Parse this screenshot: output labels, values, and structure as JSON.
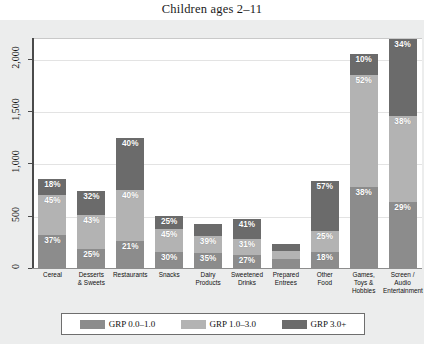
{
  "chart_data": {
    "type": "bar",
    "subtype": "stacked-bar",
    "title": "Children ages 2–11",
    "xlabel": "",
    "ylabel": "",
    "ylim": [
      0,
      2200
    ],
    "yticks": [
      0,
      500,
      1000,
      1500,
      2000
    ],
    "ytick_labels": [
      "0",
      "500",
      "1,000",
      "1,500",
      "2,000"
    ],
    "grid": true,
    "legend_position": "bottom",
    "stacked": true,
    "categories": [
      "Cereal",
      "Desserts\n& Sweets",
      "Restaurants",
      "Snacks",
      "Dairy\nProducts",
      "Sweetened\nDrinks",
      "Prepared\nEntrees",
      "Other\nFood",
      "Games,\nToys &\nHobbies",
      "Screen /\nAudio\nEntertainment"
    ],
    "series": [
      {
        "name": "GRP 0.0–1.0",
        "color": "#8c8c8c",
        "values": [
          315,
          185,
          258,
          150,
          147,
          127,
          83,
          149,
          779,
          629
        ],
        "percent_labels": [
          "37%",
          "25%",
          "21%",
          "30%",
          "35%",
          "27%",
          "",
          "18%",
          "38%",
          "29%"
        ]
      },
      {
        "name": "GRP 1.0–3.0",
        "color": "#b3b3b3",
        "values": [
          383,
          318,
          492,
          225,
          164,
          146,
          78,
          208,
          1066,
          825
        ],
        "percent_labels": [
          "45%",
          "43%",
          "40%",
          "45%",
          "39%",
          "31%",
          "",
          "25%",
          "52%",
          "38%"
        ]
      },
      {
        "name": "GRP 3.0+",
        "color": "#6b6b6b",
        "values": [
          153,
          237,
          492,
          125,
          109,
          193,
          69,
          473,
          205,
          738
        ],
        "percent_labels": [
          "18%",
          "32%",
          "40%",
          "25%",
          "",
          "41%",
          "",
          "57%",
          "10%",
          "34%"
        ]
      }
    ],
    "totals": [
      851,
      740,
      1242,
      500,
      420,
      466,
      230,
      830,
      2050,
      2192
    ]
  },
  "legend": {
    "items": [
      {
        "label": "GRP 0.0–1.0",
        "color": "#8c8c8c"
      },
      {
        "label": "GRP 1.0–3.0",
        "color": "#b3b3b3"
      },
      {
        "label": "GRP 3.0+",
        "color": "#6b6b6b"
      }
    ]
  }
}
